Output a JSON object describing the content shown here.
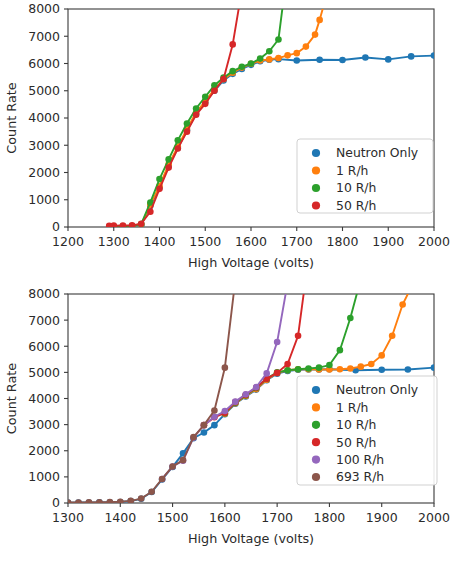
{
  "figure": {
    "background": "#ffffff",
    "axis_color": "#3a3a3a",
    "text_color": "#2b2b2b"
  },
  "palette": {
    "blue": "#1f77b4",
    "orange": "#ff7f0e",
    "green": "#2ca02c",
    "red": "#d62728",
    "purple": "#9467bd",
    "brown": "#8c564b"
  },
  "chart_data": [
    {
      "id": "top",
      "type": "line",
      "title": "",
      "xlabel": "High Voltage (volts)",
      "ylabel": "Count Rate",
      "xlim": [
        1200,
        2000
      ],
      "ylim": [
        0,
        8000
      ],
      "xticks": [
        1200,
        1300,
        1400,
        1500,
        1600,
        1700,
        1800,
        1900,
        2000
      ],
      "yticks": [
        0,
        1000,
        2000,
        3000,
        4000,
        5000,
        6000,
        7000,
        8000
      ],
      "grid": false,
      "legend_position": "lower right",
      "markers": true,
      "series": [
        {
          "name": "Neutron Only",
          "color": "#1f77b4",
          "x": [
            1300,
            1320,
            1340,
            1360,
            1380,
            1400,
            1420,
            1440,
            1460,
            1480,
            1500,
            1520,
            1540,
            1560,
            1580,
            1600,
            1620,
            1640,
            1660,
            1700,
            1750,
            1800,
            1850,
            1900,
            1950,
            2000
          ],
          "y": [
            10,
            15,
            20,
            60,
            780,
            1450,
            2250,
            2900,
            3550,
            4150,
            4580,
            5000,
            5380,
            5620,
            5800,
            5950,
            6080,
            6140,
            6160,
            6110,
            6140,
            6130,
            6220,
            6150,
            6260,
            6290
          ]
        },
        {
          "name": "1 R/h",
          "color": "#ff7f0e",
          "x": [
            1300,
            1320,
            1340,
            1360,
            1380,
            1400,
            1420,
            1440,
            1460,
            1480,
            1500,
            1520,
            1540,
            1560,
            1580,
            1600,
            1620,
            1640,
            1660,
            1680,
            1700,
            1720,
            1740,
            1750,
            1760
          ],
          "y": [
            15,
            20,
            30,
            90,
            820,
            1500,
            2300,
            2950,
            3600,
            4200,
            4620,
            5050,
            5420,
            5660,
            5850,
            5990,
            6110,
            6150,
            6200,
            6300,
            6380,
            6620,
            7060,
            7600,
            8200
          ]
        },
        {
          "name": "10 R/h",
          "color": "#2ca02c",
          "x": [
            1300,
            1320,
            1340,
            1360,
            1380,
            1400,
            1420,
            1440,
            1460,
            1480,
            1500,
            1520,
            1540,
            1560,
            1580,
            1600,
            1620,
            1640,
            1660,
            1670
          ],
          "y": [
            20,
            25,
            35,
            110,
            900,
            1760,
            2480,
            3180,
            3800,
            4350,
            4780,
            5200,
            5480,
            5720,
            5880,
            6000,
            6180,
            6450,
            6880,
            8200
          ]
        },
        {
          "name": "50 R/h",
          "color": "#d62728",
          "x": [
            1290,
            1300,
            1320,
            1340,
            1360,
            1380,
            1400,
            1420,
            1440,
            1460,
            1480,
            1500,
            1520,
            1540,
            1560,
            1575
          ],
          "y": [
            40,
            50,
            55,
            60,
            120,
            560,
            1400,
            2180,
            2880,
            3500,
            4120,
            4520,
            5000,
            5430,
            6700,
            8200
          ]
        }
      ]
    },
    {
      "id": "bottom",
      "type": "line",
      "title": "",
      "xlabel": "High Voltage (volts)",
      "ylabel": "Count Rate",
      "xlim": [
        1300,
        2000
      ],
      "ylim": [
        0,
        8000
      ],
      "xticks": [
        1300,
        1400,
        1500,
        1600,
        1700,
        1800,
        1900,
        2000
      ],
      "yticks": [
        0,
        1000,
        2000,
        3000,
        4000,
        5000,
        6000,
        7000,
        8000
      ],
      "grid": false,
      "legend_position": "lower right",
      "markers": true,
      "series": [
        {
          "name": "Neutron Only",
          "color": "#1f77b4",
          "x": [
            1300,
            1320,
            1340,
            1360,
            1380,
            1400,
            1420,
            1440,
            1460,
            1480,
            1500,
            1520,
            1540,
            1560,
            1580,
            1600,
            1620,
            1640,
            1660,
            1680,
            1700,
            1720,
            1740,
            1760,
            1780,
            1800,
            1850,
            1900,
            1950,
            2000
          ],
          "y": [
            15,
            18,
            20,
            25,
            30,
            40,
            70,
            160,
            420,
            900,
            1380,
            1900,
            2480,
            2700,
            2980,
            3400,
            3800,
            4080,
            4340,
            4700,
            4950,
            5050,
            5100,
            5110,
            5110,
            5120,
            5080,
            5100,
            5110,
            5180
          ]
        },
        {
          "name": "1 R/h",
          "color": "#ff7f0e",
          "x": [
            1600,
            1620,
            1640,
            1660,
            1680,
            1700,
            1720,
            1740,
            1760,
            1780,
            1800,
            1820,
            1840,
            1860,
            1880,
            1900,
            1920,
            1940,
            1955
          ],
          "y": [
            3420,
            3820,
            4100,
            4360,
            4720,
            4980,
            5080,
            5120,
            5120,
            5110,
            5110,
            5120,
            5150,
            5220,
            5320,
            5650,
            6400,
            7600,
            8200
          ]
        },
        {
          "name": "10 R/h",
          "color": "#2ca02c",
          "x": [
            1600,
            1620,
            1640,
            1660,
            1680,
            1700,
            1720,
            1740,
            1760,
            1780,
            1800,
            1820,
            1840,
            1855
          ],
          "y": [
            3440,
            3840,
            4120,
            4400,
            4760,
            5000,
            5080,
            5120,
            5150,
            5180,
            5280,
            5850,
            7080,
            8200
          ]
        },
        {
          "name": "50 R/h",
          "color": "#d62728",
          "x": [
            1560,
            1580,
            1600,
            1620,
            1640,
            1660,
            1680,
            1700,
            1720,
            1740,
            1752
          ],
          "y": [
            2980,
            3280,
            3450,
            3860,
            4140,
            4420,
            4760,
            4980,
            5320,
            6400,
            8200
          ]
        },
        {
          "name": "100 R/h",
          "color": "#9467bd",
          "x": [
            1480,
            1500,
            1520,
            1540,
            1560,
            1580,
            1600,
            1620,
            1640,
            1660,
            1680,
            1700,
            1718
          ],
          "y": [
            920,
            1400,
            1620,
            2500,
            2980,
            3300,
            3520,
            3880,
            4160,
            4440,
            4960,
            6160,
            8200
          ]
        },
        {
          "name": "693 R/h",
          "color": "#8c564b",
          "x": [
            1300,
            1320,
            1340,
            1360,
            1380,
            1400,
            1420,
            1440,
            1460,
            1480,
            1500,
            1520,
            1540,
            1560,
            1580,
            1600,
            1618
          ],
          "y": [
            20,
            22,
            25,
            28,
            35,
            45,
            80,
            170,
            430,
            920,
            1400,
            1640,
            2520,
            2980,
            3540,
            5180,
            8200
          ]
        }
      ]
    }
  ]
}
